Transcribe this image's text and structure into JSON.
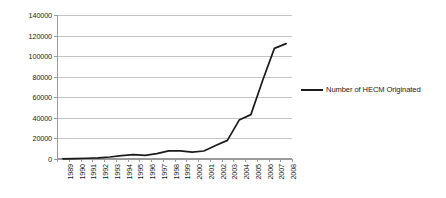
{
  "chart_data": {
    "type": "line",
    "title": "",
    "xlabel": "",
    "ylabel": "",
    "grid": true,
    "legend_position": "right",
    "ylim": [
      0,
      140000
    ],
    "ytick_step": 20000,
    "yticks": [
      0,
      20000,
      40000,
      60000,
      80000,
      100000,
      120000,
      140000
    ],
    "ytick_labels": [
      "0",
      "20000",
      "40000",
      "60000",
      "80000",
      "100000",
      "120000",
      "140000"
    ],
    "categories": [
      "1989",
      "1990",
      "1991",
      "1992",
      "1993",
      "1994",
      "1995",
      "1996",
      "1997",
      "1998",
      "1999",
      "2000",
      "2001",
      "2002",
      "2003",
      "2004",
      "2005",
      "2006",
      "2007",
      "2008"
    ],
    "series": [
      {
        "name": "Number of HECM Originated",
        "color": "#1b1b1b",
        "values": [
          157,
          389,
          719,
          1019,
          1964,
          3365,
          4166,
          3596,
          5208,
          7896,
          7982,
          6640,
          7757,
          13049,
          18097,
          37829,
          43131,
          76351,
          107558,
          112154
        ]
      }
    ]
  },
  "legend": {
    "entries": [
      {
        "label": "Number of HECM Originated"
      }
    ]
  }
}
